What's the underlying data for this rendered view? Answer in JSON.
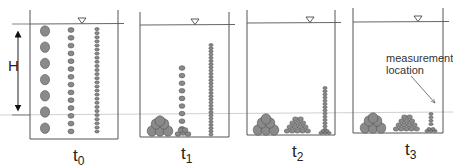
{
  "diagram": {
    "type": "sedimentation-settling-sequence",
    "height_label": "H",
    "annotation": "measurement\nlocation",
    "annotation_lines": [
      "measurement",
      "location"
    ],
    "colors": {
      "outline": "#555555",
      "particle_fill": "#8a8a8a",
      "particle_stroke": "#555555",
      "reference_line": "#bbbbbb",
      "text": "#222222"
    },
    "panels": [
      {
        "id": "t0",
        "label_base": "t",
        "label_sub": "0",
        "description": "All particle sizes suspended uniformly over depth H"
      },
      {
        "id": "t1",
        "label_base": "t",
        "label_sub": "1",
        "description": "Large particles settled; medium partially settled; small mostly suspended"
      },
      {
        "id": "t2",
        "label_base": "t",
        "label_sub": "2",
        "description": "Large and medium settled; small particles partially settled"
      },
      {
        "id": "t3",
        "label_base": "t",
        "label_sub": "3",
        "description": "Nearly all particles settled; arrow marks measurement location near bottom"
      }
    ],
    "particle_classes": [
      "large",
      "medium",
      "small"
    ],
    "water_surface_symbol": "inverted-triangle"
  }
}
